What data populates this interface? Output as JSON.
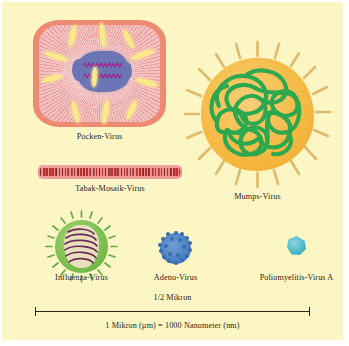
{
  "figure": {
    "background_color": "#fbf6c4",
    "type": "scientific-illustration"
  },
  "specimens": [
    {
      "id": "pocken",
      "label": "Pocken-Virus",
      "shape": "rounded-rectangle",
      "colors": {
        "membrane": "#ef8a72",
        "matrix": "#f3c3c4",
        "core": "#6b74b4",
        "dna": "#a3228c",
        "spikes": "#fbe98a"
      }
    },
    {
      "id": "mumps",
      "label": "Mumps-Virus",
      "shape": "sphere-with-spikes",
      "colors": {
        "body": "#f5b942",
        "coil": "#2ea84f",
        "spikes": "#e6c37a"
      }
    },
    {
      "id": "tabak",
      "label": "Tabak-Mosaik-Virus",
      "shape": "rod",
      "colors": {
        "rod": "#e88a84",
        "subunits": "#b5282b"
      }
    },
    {
      "id": "influenza",
      "label": "Influenza-Virus",
      "shape": "sphere-with-spikes",
      "colors": {
        "body": "#7cc04f",
        "core": "#e8e0bd",
        "helix": "#6b2a52"
      }
    },
    {
      "id": "adeno",
      "label": "Adeno-Virus",
      "shape": "icosahedral-sphere",
      "colors": {
        "body": "#4a7fc0",
        "capsomeres": "#3a6bab"
      }
    },
    {
      "id": "polio",
      "label": "Poliomyelitis-Virus A",
      "shape": "small-polygon",
      "colors": {
        "body": "#4ab6c6"
      }
    }
  ],
  "scale": {
    "above_label": "1/2 Mikron",
    "below_label": "1 Mikron (µm) = 1000 Nanometer (nm)",
    "line_color": "#2b2417"
  }
}
